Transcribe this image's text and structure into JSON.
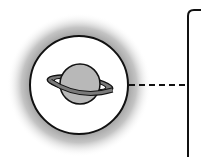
{
  "diagram": {
    "type": "icon-callout",
    "nodes": [
      {
        "id": "planet",
        "shape": "circle",
        "icon": "saturn-icon",
        "glow": true
      },
      {
        "id": "panel",
        "shape": "rounded-rectangle",
        "partially_visible": true
      }
    ],
    "edges": [
      {
        "from": "planet",
        "to": "panel",
        "style": "dashed"
      }
    ],
    "colors": {
      "outline": "#111111",
      "planet_fill": "#b8b8b8",
      "ring_fill": "#7a7a7a",
      "glow_inner": "#8a8a8a",
      "background": "#ffffff"
    }
  }
}
